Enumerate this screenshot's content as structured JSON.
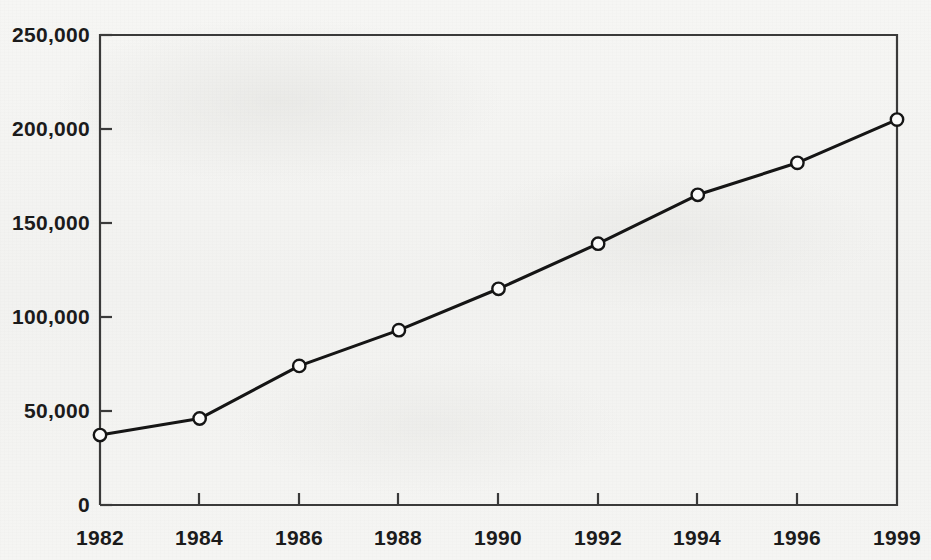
{
  "chart_data": {
    "type": "line",
    "title": "",
    "subtitle": "",
    "xlabel": "",
    "ylabel": "",
    "categories": [
      "1982",
      "1984",
      "1986",
      "1988",
      "1990",
      "1992",
      "1994",
      "1996",
      "1999"
    ],
    "values": [
      37200,
      46000,
      74000,
      93000,
      115000,
      139000,
      165000,
      182000,
      205000
    ],
    "series": [
      {
        "name": "",
        "values": [
          37200,
          46000,
          74000,
          93000,
          115000,
          139000,
          165000,
          182000,
          205000
        ]
      }
    ],
    "ylim": [
      0,
      250000
    ],
    "y_ticks": [
      0,
      50000,
      100000,
      150000,
      200000,
      250000
    ],
    "y_tick_labels": [
      "0",
      "50,000",
      "100,000",
      "150,000",
      "200,000",
      "250,000"
    ],
    "x_tick_labels": [
      "1982",
      "1984",
      "1986",
      "1988",
      "1990",
      "1992",
      "1994",
      "1996",
      "1999"
    ],
    "grid": false,
    "legend": null,
    "legend_position": "none",
    "marker": "open-circle",
    "line_color": "#151515",
    "marker_fill": "#fbfbfa",
    "marker_stroke": "#151515",
    "axis_color": "#3a3a3a",
    "background_color": "#f4f4f2",
    "annotations": []
  },
  "axes": {
    "frame": {
      "left": 100,
      "top": 35,
      "right": 897,
      "bottom": 505
    },
    "note": "y axis drawn on left and top/right frame lines present; x categories equally spaced"
  }
}
